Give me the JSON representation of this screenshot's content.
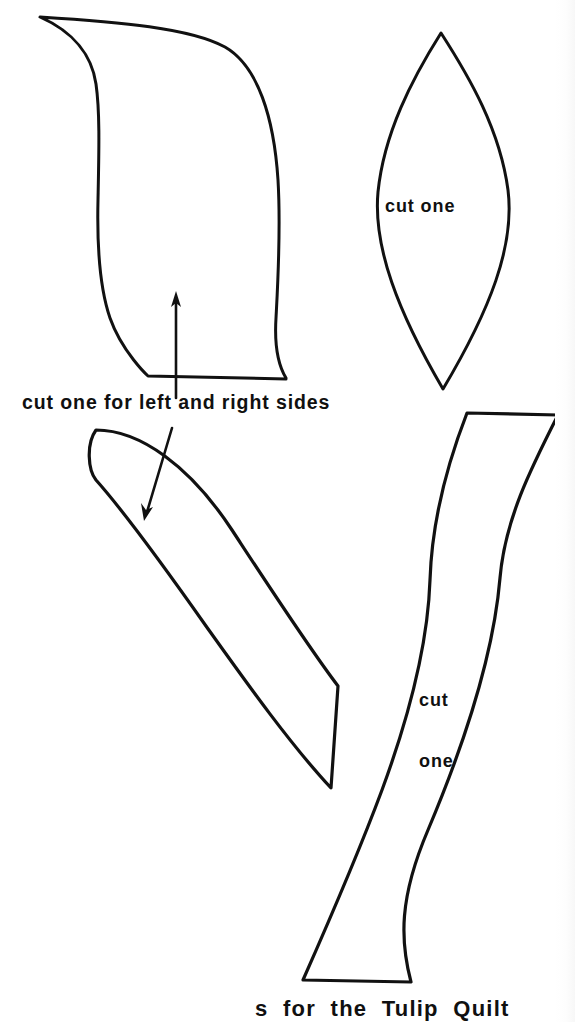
{
  "page": {
    "width": 575,
    "height": 1022,
    "background_color": "#ffffff",
    "ink_color": "#111111",
    "document_type": "quilt pattern template sheet"
  },
  "labels": {
    "petal_side": "cut one for left and right sides",
    "leaf": "cut one",
    "stem_line1": "cut",
    "stem_line2": "one",
    "caption_partial": "s  for  the  Tulip  Quilt"
  },
  "shapes": [
    {
      "name": "petal-left-right-template",
      "label": "cut one for left and right sides",
      "description": "large curved petal piece, top-left",
      "bbox": [
        38,
        15,
        288,
        382
      ],
      "grain_arrow": {
        "direction": "up",
        "from": [
          176,
          396
        ],
        "to": [
          176,
          293
        ]
      }
    },
    {
      "name": "leaf-template",
      "label": "cut one",
      "description": "pointed oval leaf, top-right",
      "bbox": [
        372,
        32,
        512,
        392
      ],
      "grain_arrow": null
    },
    {
      "name": "crescent-template",
      "label": "cut one for left and right sides",
      "description": "curved crescent calyx piece, bottom-left",
      "bbox": [
        88,
        428,
        340,
        792
      ],
      "grain_arrow": {
        "direction": "down-left",
        "from": [
          170,
          430
        ],
        "to": [
          145,
          518
        ]
      }
    },
    {
      "name": "stem-template",
      "label": "cut one",
      "description": "long S-curved stem strip, bottom-right",
      "bbox": [
        300,
        410,
        560,
        985
      ],
      "grain_arrow": null
    }
  ]
}
